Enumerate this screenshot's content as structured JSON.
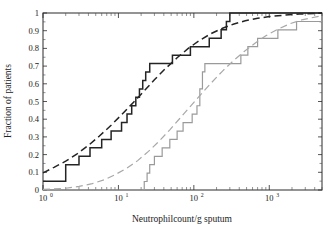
{
  "chart_data": {
    "type": "line",
    "title": "",
    "xlabel": "Neutrophilcount/g sputum",
    "ylabel": "Fraction of patients",
    "xscale": "log",
    "xlim": [
      1,
      5000
    ],
    "ylim": [
      0,
      1
    ],
    "grid": false,
    "legend": null,
    "xticks": [
      1,
      10,
      100,
      1000
    ],
    "xtick_labels": [
      "10",
      "10",
      "10",
      "10"
    ],
    "xtick_exponents": [
      "0",
      "1",
      "2",
      "3"
    ],
    "yticks": [
      0,
      0.1,
      0.2,
      0.3,
      0.4,
      0.5,
      0.6,
      0.7,
      0.8,
      0.9,
      1
    ],
    "ytick_labels": [
      "0",
      "0.1",
      "0.2",
      "0.3",
      "0.4",
      "0.5",
      "0.6",
      "0.7",
      "0.8",
      "0.9",
      "1"
    ],
    "series": [
      {
        "name": "empirical-cdf-group-a",
        "style": "step",
        "color": "#242424",
        "points": [
          [
            1.0,
            0.05
          ],
          [
            2.0,
            0.05
          ],
          [
            2.0,
            0.143
          ],
          [
            3.0,
            0.143
          ],
          [
            3.0,
            0.19
          ],
          [
            4.2,
            0.19
          ],
          [
            4.2,
            0.238
          ],
          [
            6.0,
            0.238
          ],
          [
            6.0,
            0.286
          ],
          [
            8.0,
            0.286
          ],
          [
            8.0,
            0.333
          ],
          [
            11.0,
            0.333
          ],
          [
            11.0,
            0.381
          ],
          [
            13.0,
            0.381
          ],
          [
            13.0,
            0.429
          ],
          [
            15.0,
            0.429
          ],
          [
            15.0,
            0.476
          ],
          [
            17.0,
            0.476
          ],
          [
            17.0,
            0.524
          ],
          [
            19.0,
            0.524
          ],
          [
            19.0,
            0.571
          ],
          [
            21.0,
            0.571
          ],
          [
            21.0,
            0.619
          ],
          [
            23.0,
            0.619
          ],
          [
            23.0,
            0.667
          ],
          [
            26.0,
            0.667
          ],
          [
            26.0,
            0.714
          ],
          [
            52.0,
            0.714
          ],
          [
            52.0,
            0.762
          ],
          [
            90.0,
            0.762
          ],
          [
            90.0,
            0.81
          ],
          [
            160.0,
            0.81
          ],
          [
            160.0,
            0.857
          ],
          [
            230.0,
            0.857
          ],
          [
            230.0,
            0.905
          ],
          [
            270.0,
            0.905
          ],
          [
            270.0,
            0.952
          ],
          [
            300.0,
            0.952
          ],
          [
            300.0,
            1.0
          ],
          [
            5000.0,
            1.0
          ]
        ]
      },
      {
        "name": "lognormal-fit-group-a",
        "style": "dashed",
        "color": "#242424",
        "points": [
          [
            1.0,
            0.097
          ],
          [
            1.4,
            0.128
          ],
          [
            2.0,
            0.163
          ],
          [
            2.8,
            0.203
          ],
          [
            4.0,
            0.252
          ],
          [
            5.6,
            0.305
          ],
          [
            8.0,
            0.366
          ],
          [
            11.0,
            0.425
          ],
          [
            16.0,
            0.497
          ],
          [
            22.0,
            0.56
          ],
          [
            30.0,
            0.623
          ],
          [
            42.0,
            0.686
          ],
          [
            60.0,
            0.747
          ],
          [
            85.0,
            0.801
          ],
          [
            120.0,
            0.846
          ],
          [
            170.0,
            0.884
          ],
          [
            240.0,
            0.914
          ],
          [
            340.0,
            0.938
          ],
          [
            480.0,
            0.956
          ],
          [
            700.0,
            0.97
          ],
          [
            1000.0,
            0.98
          ],
          [
            1600.0,
            0.988
          ],
          [
            2500.0,
            0.994
          ],
          [
            5000.0,
            0.999
          ]
        ]
      },
      {
        "name": "empirical-cdf-group-b",
        "style": "step",
        "color": "#9a9a9a",
        "points": [
          [
            1.0,
            0.0
          ],
          [
            22.0,
            0.0
          ],
          [
            22.0,
            0.048
          ],
          [
            24.0,
            0.048
          ],
          [
            24.0,
            0.095
          ],
          [
            26.0,
            0.095
          ],
          [
            26.0,
            0.143
          ],
          [
            30.0,
            0.143
          ],
          [
            30.0,
            0.19
          ],
          [
            38.0,
            0.19
          ],
          [
            38.0,
            0.238
          ],
          [
            48.0,
            0.238
          ],
          [
            48.0,
            0.286
          ],
          [
            60.0,
            0.286
          ],
          [
            60.0,
            0.333
          ],
          [
            72.0,
            0.333
          ],
          [
            72.0,
            0.381
          ],
          [
            95.0,
            0.381
          ],
          [
            95.0,
            0.429
          ],
          [
            110.0,
            0.429
          ],
          [
            110.0,
            0.476
          ],
          [
            120.0,
            0.476
          ],
          [
            120.0,
            0.571
          ],
          [
            130.0,
            0.571
          ],
          [
            130.0,
            0.667
          ],
          [
            140.0,
            0.667
          ],
          [
            140.0,
            0.714
          ],
          [
            420.0,
            0.714
          ],
          [
            420.0,
            0.762
          ],
          [
            520.0,
            0.762
          ],
          [
            520.0,
            0.81
          ],
          [
            700.0,
            0.81
          ],
          [
            700.0,
            0.857
          ],
          [
            1300.0,
            0.857
          ],
          [
            1300.0,
            0.905
          ],
          [
            2300.0,
            0.905
          ],
          [
            2300.0,
            0.952
          ],
          [
            5000.0,
            0.952
          ]
        ]
      },
      {
        "name": "lognormal-fit-group-b",
        "style": "dashed",
        "color": "#a8a8a8",
        "points": [
          [
            1.0,
            0.003
          ],
          [
            2.0,
            0.01
          ],
          [
            3.0,
            0.02
          ],
          [
            4.5,
            0.036
          ],
          [
            6.5,
            0.058
          ],
          [
            9.0,
            0.086
          ],
          [
            13.0,
            0.124
          ],
          [
            18.0,
            0.166
          ],
          [
            25.0,
            0.218
          ],
          [
            35.0,
            0.278
          ],
          [
            48.0,
            0.34
          ],
          [
            65.0,
            0.404
          ],
          [
            90.0,
            0.473
          ],
          [
            125.0,
            0.542
          ],
          [
            170.0,
            0.605
          ],
          [
            240.0,
            0.672
          ],
          [
            330.0,
            0.728
          ],
          [
            460.0,
            0.781
          ],
          [
            640.0,
            0.828
          ],
          [
            900.0,
            0.871
          ],
          [
            1300.0,
            0.909
          ],
          [
            1900.0,
            0.94
          ],
          [
            2800.0,
            0.963
          ],
          [
            5000.0,
            0.985
          ]
        ]
      }
    ]
  }
}
